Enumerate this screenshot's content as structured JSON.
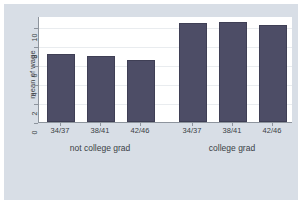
{
  "chart_data": {
    "type": "bar",
    "title": "",
    "subtitle": "",
    "xlabel": "",
    "ylabel": "mean of wage",
    "ylim": [
      0,
      11.2
    ],
    "yticks": [
      0,
      2,
      4,
      6,
      8,
      10
    ],
    "ytick_labels": [
      "0",
      "2",
      "4",
      "6",
      "8",
      "10"
    ],
    "grid": true,
    "legend": "none",
    "categories": [
      "34/37",
      "38/41",
      "42/46"
    ],
    "groups": [
      {
        "name": "not college grad",
        "categories": [
          "34/37",
          "38/41",
          "42/46"
        ],
        "values": [
          7.2,
          7.0,
          6.5
        ]
      },
      {
        "name": "college grad",
        "categories": [
          "34/37",
          "38/41",
          "42/46"
        ],
        "values": [
          10.5,
          10.6,
          10.3
        ]
      }
    ],
    "bar_color": "#4d4d66",
    "plot_background": "#ffffff",
    "figure_background": "#d8dee6",
    "axis_color": "#8d949d",
    "gridline_color": "#e9ecef"
  }
}
